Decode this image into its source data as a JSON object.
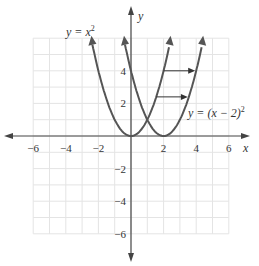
{
  "chart_data": {
    "type": "line",
    "title": "",
    "xlabel": "x",
    "ylabel": "y",
    "xlim": [
      -6,
      6
    ],
    "ylim": [
      -6,
      6
    ],
    "grid": true,
    "x_ticks": [
      "−6",
      "−4",
      "−2",
      "2",
      "4",
      "6"
    ],
    "y_ticks": [
      "4",
      "2",
      "−2",
      "−4",
      "−6"
    ],
    "series": [
      {
        "name": "y = x²",
        "formula": "x^2",
        "color": "#555555"
      },
      {
        "name": "y = (x − 2)²",
        "formula": "(x-2)^2",
        "color": "#555555"
      }
    ],
    "annotations": [
      {
        "type": "arrow",
        "from": [
          1.5,
          4
        ],
        "to": [
          4,
          4
        ],
        "text": "horizontal shift right 2"
      },
      {
        "type": "arrow",
        "from": [
          0.7,
          2.4
        ],
        "to": [
          3.3,
          2.4
        ],
        "text": "horizontal shift right 2"
      }
    ],
    "labels": {
      "curve1": "y = x",
      "curve1_exp": "2",
      "curve2": "y = (x − 2)",
      "curve2_exp": "2"
    }
  }
}
